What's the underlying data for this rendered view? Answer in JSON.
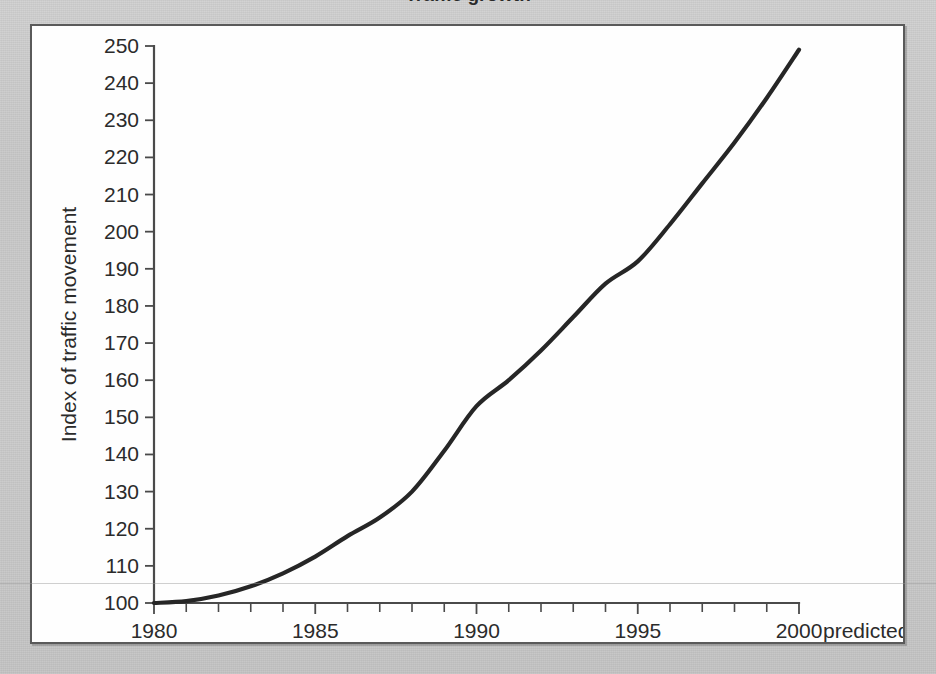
{
  "page": {
    "title_fragment": "Traffic growth",
    "background_color": "#c8c8c8",
    "figure_background": "#fefefe",
    "frame_color": "#5a5a5a"
  },
  "chart_data": {
    "type": "line",
    "title": "",
    "xlabel": "Year",
    "ylabel": "Index of traffic movement",
    "xlim": [
      1980,
      2000
    ],
    "ylim": [
      100,
      250
    ],
    "grid": false,
    "legend": null,
    "line_color": "#262626",
    "x": [
      1980,
      1981,
      1982,
      1983,
      1984,
      1985,
      1986,
      1987,
      1988,
      1989,
      1990,
      1991,
      1992,
      1993,
      1994,
      1995,
      1996,
      1997,
      1998,
      1999,
      2000
    ],
    "values": [
      100,
      100.5,
      102,
      104.5,
      108,
      112.5,
      118,
      123,
      130,
      141,
      153,
      160,
      168,
      177,
      186,
      192,
      202,
      213,
      224,
      236,
      249
    ],
    "series": [
      {
        "name": "Index of traffic movement",
        "values": [
          100,
          100.5,
          102,
          104.5,
          108,
          112.5,
          118,
          123,
          130,
          141,
          153,
          160,
          168,
          177,
          186,
          192,
          202,
          213,
          224,
          236,
          249
        ]
      }
    ],
    "x_tick_labels": [
      "1980",
      "1985",
      "1990",
      "1995",
      "2000"
    ],
    "x_tick_values": [
      1980,
      1985,
      1990,
      1995,
      2000
    ],
    "x_minor_tick_interval": 1,
    "y_tick_labels": [
      "100",
      "110",
      "120",
      "130",
      "140",
      "150",
      "160",
      "170",
      "180",
      "190",
      "200",
      "210",
      "220",
      "230",
      "240",
      "250"
    ],
    "y_tick_values": [
      100,
      110,
      120,
      130,
      140,
      150,
      160,
      170,
      180,
      190,
      200,
      210,
      220,
      230,
      240,
      250
    ],
    "annotations": [
      {
        "text": "predicted",
        "x": 2000,
        "position": "right-of-axis-end"
      }
    ]
  }
}
